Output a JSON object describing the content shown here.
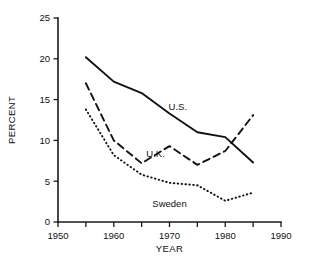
{
  "chart_data": {
    "type": "line",
    "title": "",
    "xlabel": "YEAR",
    "ylabel": "PERCENT",
    "xlim": [
      1950,
      1990
    ],
    "ylim": [
      0,
      25
    ],
    "grid": false,
    "legend_position": "inline-labels",
    "x": [
      1955,
      1960,
      1965,
      1970,
      1975,
      1980,
      1985
    ],
    "xticks": [
      1950,
      1955,
      1960,
      1965,
      1970,
      1975,
      1980,
      1985,
      1990
    ],
    "xtick_labels": [
      "1950",
      "",
      "1960",
      "",
      "1970",
      "",
      "1980",
      "",
      "1990"
    ],
    "yticks": [
      0,
      5,
      10,
      15,
      20,
      25
    ],
    "ytick_labels": [
      "0",
      "5",
      "10",
      "15",
      "20",
      "25"
    ],
    "series": [
      {
        "name": "U.S.",
        "style": "solid",
        "values": [
          20.2,
          17.2,
          15.8,
          13.3,
          11.0,
          10.4,
          7.3
        ],
        "label_x": 1971.5,
        "label_y": 13.7
      },
      {
        "name": "U.K.",
        "style": "dashed",
        "values": [
          17.0,
          10.0,
          7.2,
          9.3,
          7.0,
          8.7,
          13.1
        ],
        "label_x": 1967.5,
        "label_y": 8.0
      },
      {
        "name": "Sweden",
        "style": "dotted",
        "values": [
          13.8,
          8.2,
          5.8,
          4.8,
          4.5,
          2.6,
          3.6
        ],
        "label_x": 1970.0,
        "label_y": 1.8
      }
    ]
  },
  "axes": {
    "y_axis_title": "PERCENT",
    "x_axis_title": "YEAR"
  },
  "colors": {
    "ink": "#111111",
    "background": "#ffffff"
  }
}
